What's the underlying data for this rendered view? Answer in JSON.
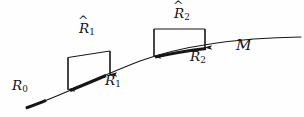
{
  "figure": {
    "kind": "manifold-discretization-diagram",
    "background_color": "#fefefe",
    "ink_color": "#161616",
    "width": 304,
    "height": 117,
    "labels": {
      "r0": {
        "base": "R",
        "sub": "0",
        "hat": false,
        "text": "R0"
      },
      "r1": {
        "base": "R",
        "sub": "1",
        "hat": false,
        "text": "R1"
      },
      "r2": {
        "base": "R",
        "sub": "2",
        "hat": false,
        "text": "R2"
      },
      "rhat1": {
        "base": "R",
        "sub": "1",
        "hat": true,
        "hat_glyph": "^",
        "text": "R̂1"
      },
      "rhat2": {
        "base": "R",
        "sub": "2",
        "hat": true,
        "hat_glyph": "^",
        "text": "R̂2"
      },
      "manifold": {
        "base": "M",
        "sub": "",
        "hat": false,
        "text": "M"
      }
    },
    "curve": {
      "name": "manifold-curve",
      "path": "M 26 108 C 60 96 96 78 140 61 C 184 45 240 38 301 37",
      "stroke_width": 1.1
    },
    "bold_segments": [
      {
        "name": "segment-r0",
        "path": "M 26 108 C 32 105.8 39 103.2 46 100.3",
        "stroke_width": 3.0
      },
      {
        "name": "segment-r1",
        "path": "M 70 90.5 C 80 86.5 93 81.0 106 75.5",
        "stroke_width": 3.0
      },
      {
        "name": "segment-r2",
        "path": "M 155 57.0 C 170 53.6 188 50.6 206 48.4",
        "stroke_width": 3.0
      }
    ],
    "brackets": [
      {
        "name": "bracket-rhat1",
        "outline": "M 68 90.0 L 68 57.5 L 110 51.0 L 110 75.0",
        "arrow_left": {
          "x1": 68,
          "y1": 57.5,
          "x2": 68,
          "y2": 89.5
        },
        "arrow_right": {
          "x1": 110,
          "y1": 51.0,
          "x2": 110,
          "y2": 74.5
        },
        "stroke_width": 1.0
      },
      {
        "name": "bracket-rhat2",
        "outline": "M 154 57.0 L 154 29.0 L 205 29.0 L 205 48.0",
        "arrow_left": {
          "x1": 154,
          "y1": 29.0,
          "x2": 154,
          "y2": 56.5
        },
        "arrow_right": {
          "x1": 205,
          "y1": 29.0,
          "x2": 205,
          "y2": 47.5
        },
        "stroke_width": 1.0
      }
    ]
  }
}
